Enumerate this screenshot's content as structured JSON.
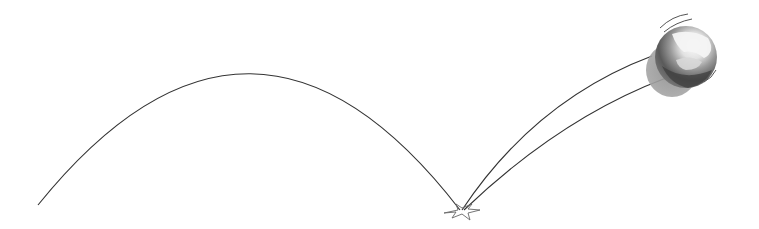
{
  "illustration": {
    "subject": "bouncing ball trajectory",
    "background_color": "#ffffff",
    "stroke_color": "#333333",
    "ball": {
      "highlight_color": "#f2f2f2",
      "mid_color": "#9a9a9a",
      "dark_color": "#4a4a4a",
      "shadow_color": "#8c8c8c"
    },
    "impact_mark_color": "#666666",
    "caption": "Ball bounce illustration"
  }
}
